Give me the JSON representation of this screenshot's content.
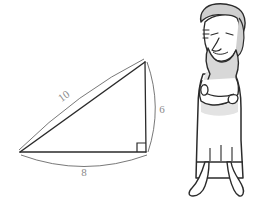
{
  "figure": {
    "background_color": "#ffffff",
    "stroke_color": "#2b2b2b",
    "label_color": "#8a8a8a",
    "shade_color": "#d8d8d8"
  },
  "triangle": {
    "name": "right-triangle",
    "vertices": {
      "left": [
        20,
        152
      ],
      "apex": [
        145,
        62
      ],
      "corner": [
        146,
        152
      ]
    },
    "right_angle_marker": {
      "present": true,
      "at": "corner",
      "size": 9
    },
    "sides": [
      {
        "name": "hypotenuse",
        "label": "10",
        "label_x": 66,
        "label_y": 99,
        "label_rotation": -36
      },
      {
        "name": "vertical-leg",
        "label": "6",
        "label_x": 162,
        "label_y": 112,
        "label_rotation": 0
      },
      {
        "name": "base",
        "label": "8",
        "label_x": 84,
        "label_y": 174,
        "label_rotation": 0
      }
    ],
    "measure_arcs": [
      {
        "name": "arc-hypotenuse-10",
        "bulge": "above"
      },
      {
        "name": "arc-vertical-6",
        "bulge": "right"
      },
      {
        "name": "arc-base-8",
        "bulge": "below"
      }
    ]
  },
  "person": {
    "name": "bearded-philosopher",
    "description": "Cartoon bearded man with arms crossed wearing a long robe",
    "parts": [
      "hair",
      "face",
      "eyes",
      "eyebrow-wrinkles",
      "nose",
      "beard",
      "torso-robe",
      "crossed-arms",
      "hands",
      "robe-skirt",
      "robe-folds",
      "legs",
      "feet"
    ]
  }
}
